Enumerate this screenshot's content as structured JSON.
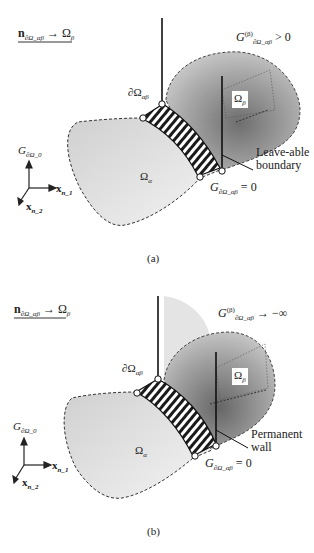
{
  "panels": [
    {
      "id": "a",
      "caption": "(a)",
      "direction_label": {
        "vector": "n",
        "vector_sub": "∂Ω_αβ",
        "arrow": "→",
        "target": "Ω",
        "target_sub": "β"
      },
      "boundary_label": {
        "symbol": "∂Ω",
        "sub": "αβ"
      },
      "beta_condition": {
        "symbol": "G",
        "sup": "(β)",
        "sub": "∂Ω_αβ",
        "relation": "> 0"
      },
      "omega_beta_label": {
        "symbol": "Ω",
        "sub": "β"
      },
      "omega_alpha_label": {
        "symbol": "Ω",
        "sub": "α"
      },
      "zero_condition": {
        "symbol": "G",
        "sub": "∂Ω_αβ",
        "relation": "= 0"
      },
      "annotation": [
        "Leave-able",
        "boundary"
      ],
      "axes": {
        "vertical": {
          "symbol": "G",
          "sub": "∂Ω_0"
        },
        "horizontal": {
          "symbol": "x",
          "sub": "n_1"
        },
        "oblique": {
          "symbol": "x",
          "sub": "n_2"
        }
      }
    },
    {
      "id": "b",
      "caption": "(b)",
      "direction_label": {
        "vector": "n",
        "vector_sub": "∂Ω_αβ",
        "arrow": "→",
        "target": "Ω",
        "target_sub": "β"
      },
      "boundary_label": {
        "symbol": "∂Ω",
        "sub": "αβ"
      },
      "beta_condition": {
        "symbol": "G",
        "sup": "(β)",
        "sub": "∂Ω_αβ",
        "relation": "→ −∞"
      },
      "omega_beta_label": {
        "symbol": "Ω",
        "sub": "β"
      },
      "omega_alpha_label": {
        "symbol": "Ω",
        "sub": "α"
      },
      "zero_condition": {
        "symbol": "G",
        "sub": "∂Ω_αβ",
        "relation": "= 0"
      },
      "annotation": [
        "Permanent",
        "wall"
      ],
      "axes": {
        "vertical": {
          "symbol": "G",
          "sub": "∂Ω_0"
        },
        "horizontal": {
          "symbol": "x",
          "sub": "n_1"
        },
        "oblique": {
          "symbol": "x",
          "sub": "n_2"
        }
      }
    }
  ],
  "colors": {
    "alpha_fill": "#dcdcdc",
    "beta_fill": "#9a9a9a",
    "line": "#222222",
    "hatch": "#1a1a1a"
  }
}
